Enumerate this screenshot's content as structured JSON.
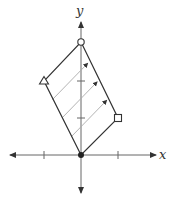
{
  "diagram": {
    "type": "coordinate-plane-translation",
    "axes": {
      "x_label": "x",
      "y_label": "y",
      "x_ticks": [
        -1,
        1
      ],
      "y_ticks": [
        1,
        2
      ]
    },
    "vertices": [
      {
        "name": "origin",
        "marker": "filled-circle",
        "x": 0,
        "y": 0
      },
      {
        "name": "triangle",
        "marker": "open-triangle",
        "x": -1,
        "y": 2
      },
      {
        "name": "circle",
        "marker": "open-circle",
        "x": 0,
        "y": 3
      },
      {
        "name": "square",
        "marker": "open-square",
        "x": 1,
        "y": 1
      }
    ],
    "translation_arrows": {
      "count": 3,
      "direction": [
        1,
        1
      ]
    },
    "colors": {
      "outline": "#333333",
      "axis": "#555555",
      "arrows": "#999999"
    }
  }
}
